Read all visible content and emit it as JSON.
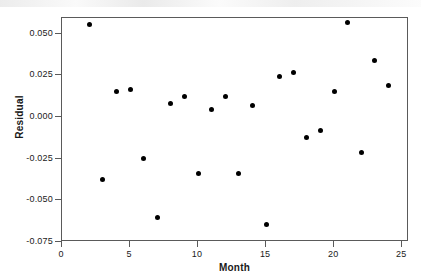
{
  "chart_data": {
    "type": "scatter",
    "title": "",
    "xlabel": "Month",
    "ylabel": "Residual",
    "xlim": [
      0,
      25.5
    ],
    "ylim": [
      -0.075,
      0.0595
    ],
    "grid": false,
    "legend": null,
    "x_ticks": [
      "0",
      "5",
      "10",
      "15",
      "20",
      "25"
    ],
    "x_tick_values": [
      0,
      5,
      10,
      15,
      20,
      25
    ],
    "y_ticks": [
      "0.050",
      "0.025",
      "0.000",
      "-0.025",
      "-0.050",
      "-0.075"
    ],
    "y_tick_values": [
      0.05,
      0.025,
      0.0,
      -0.025,
      -0.05,
      -0.075
    ],
    "marker": "filled-circle",
    "marker_color": "#000000",
    "series": [
      {
        "name": "Residual",
        "x": [
          2,
          3,
          4,
          5,
          6,
          7,
          8,
          9,
          10,
          11,
          12,
          13,
          14,
          15,
          16,
          17,
          18,
          19,
          20,
          21,
          22,
          23,
          24
        ],
        "y": [
          0.0556,
          -0.0375,
          0.0156,
          0.0163,
          -0.025,
          -0.06,
          0.0081,
          0.0125,
          -0.0338,
          0.0044,
          0.0125,
          -0.0338,
          0.0069,
          -0.0644,
          0.0244,
          0.0269,
          -0.0125,
          -0.0081,
          0.0156,
          0.0569,
          -0.0212,
          0.0338,
          0.0188
        ]
      }
    ],
    "points": [
      {
        "x": 2,
        "y": 0.0556
      },
      {
        "x": 3,
        "y": -0.0375
      },
      {
        "x": 4,
        "y": 0.0156
      },
      {
        "x": 5,
        "y": 0.0163
      },
      {
        "x": 6,
        "y": -0.025
      },
      {
        "x": 7,
        "y": -0.06
      },
      {
        "x": 8,
        "y": 0.0081
      },
      {
        "x": 9,
        "y": 0.0125
      },
      {
        "x": 10,
        "y": -0.0338
      },
      {
        "x": 11,
        "y": 0.0044
      },
      {
        "x": 12,
        "y": 0.0125
      },
      {
        "x": 13,
        "y": -0.0338
      },
      {
        "x": 14,
        "y": 0.0069
      },
      {
        "x": 15,
        "y": -0.0644
      },
      {
        "x": 16,
        "y": 0.0244
      },
      {
        "x": 17,
        "y": 0.0269
      },
      {
        "x": 18,
        "y": -0.0125
      },
      {
        "x": 19,
        "y": -0.0081
      },
      {
        "x": 20,
        "y": 0.0156
      },
      {
        "x": 21,
        "y": 0.0569
      },
      {
        "x": 22,
        "y": -0.0212
      },
      {
        "x": 23,
        "y": 0.0338
      },
      {
        "x": 24,
        "y": 0.0188
      }
    ]
  },
  "axes": {
    "x_title": "Month",
    "y_title": "Residual"
  }
}
